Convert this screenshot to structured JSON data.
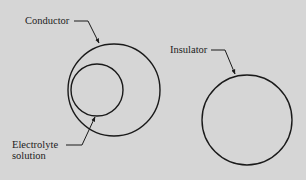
{
  "diagram": {
    "labels": {
      "conductor": "Conductor",
      "insulator": "Insulator",
      "electrolyte_line1": "Electrolyte",
      "electrolyte_line2": "solution"
    },
    "colors": {
      "background": "#d6d6d6",
      "stroke": "#1a1a1a",
      "text": "#1c1c1c"
    }
  }
}
